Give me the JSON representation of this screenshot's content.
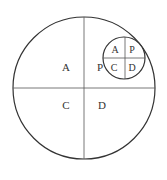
{
  "diagram": {
    "stroke_color": "#333333",
    "large_circle": {
      "quadrant_labels": {
        "top_left": "A",
        "top_right": "P",
        "bottom_left": "C",
        "bottom_right": "D"
      }
    },
    "small_circle": {
      "quadrant_labels": {
        "top_left": "A",
        "top_right": "P",
        "bottom_left": "C",
        "bottom_right": "D"
      }
    }
  }
}
